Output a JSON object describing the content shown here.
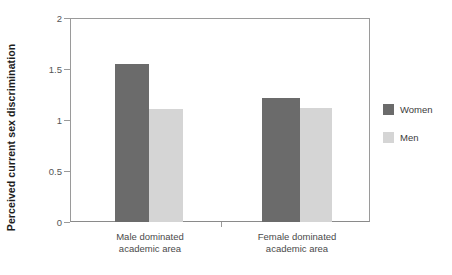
{
  "chart_data": {
    "type": "bar",
    "title": "",
    "subtitle": "",
    "xlabel": "",
    "ylabel": "Perceived current sex discrimination",
    "categories": [
      "Male dominated academic area",
      "Female dominated academic area"
    ],
    "category_lines": [
      [
        "Male dominated",
        "academic area"
      ],
      [
        "Female dominated",
        "academic area"
      ]
    ],
    "series": [
      {
        "name": "Women",
        "values": [
          1.56,
          1.22
        ],
        "color": "#6b6b6b"
      },
      {
        "name": "Men",
        "values": [
          1.11,
          1.12
        ],
        "color": "#d5d5d5"
      }
    ],
    "ylim": [
      0,
      2
    ],
    "yticks": [
      0,
      0.5,
      1,
      1.5,
      2
    ],
    "ytick_labels": [
      "0",
      "0.5",
      "1",
      "1.5",
      "2"
    ],
    "grid": false,
    "legend_position": "right",
    "legend_entries": [
      {
        "label": "Women",
        "color": "#6b6b6b"
      },
      {
        "label": "Men",
        "color": "#d5d5d5"
      }
    ],
    "axis_color": "#9a9a9a",
    "background": "#ffffff"
  }
}
